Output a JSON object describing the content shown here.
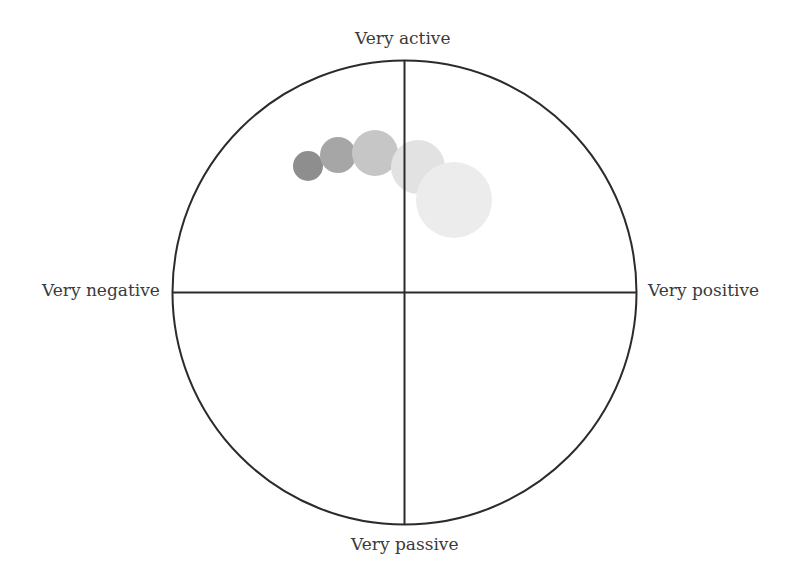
{
  "diagram": {
    "type": "circumplex",
    "axes": {
      "top": "Very active",
      "bottom": "Very passive",
      "left": "Very negative",
      "right": "Very positive"
    },
    "frame": {
      "cx": 404.5,
      "cy": 292.5,
      "r": 232,
      "stroke": "#2b2b2b",
      "stroke_width": 2
    },
    "bubbles": [
      {
        "cx": 308,
        "cy": 166,
        "r": 15,
        "fill": "#8e8e8e"
      },
      {
        "cx": 338,
        "cy": 155,
        "r": 18,
        "fill": "#a6a6a6"
      },
      {
        "cx": 375,
        "cy": 153,
        "r": 23,
        "fill": "#c6c6c6"
      },
      {
        "cx": 418,
        "cy": 167,
        "r": 27,
        "fill": "#e2e2e2"
      },
      {
        "cx": 454,
        "cy": 200,
        "r": 38,
        "fill": "#ececec"
      }
    ]
  }
}
